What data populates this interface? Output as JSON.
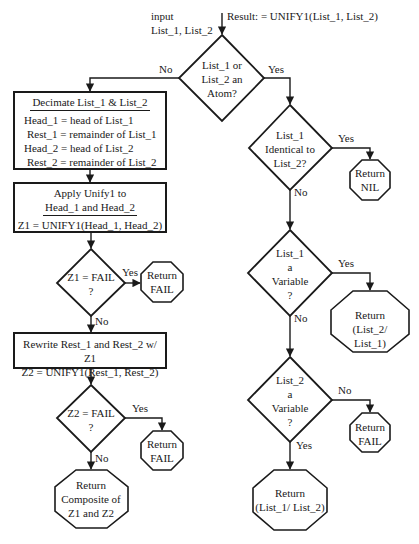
{
  "header": {
    "input_label": "input",
    "input_args": "List_1,  List_2",
    "call": "Result: = UNIFY1(List_1,  List_2)"
  },
  "nodes": {
    "atom_decision": {
      "lines": [
        "List_1 or",
        "List_2 an",
        "Atom?"
      ],
      "no": "No",
      "yes": "Yes"
    },
    "decimate_box": {
      "title": "Decimate List_1 & List_2",
      "lines": [
        "Head_1 = head of List_1",
        "Rest_1 = remainder of List_1",
        "Head_2 = head of List_2",
        "Rest_2 = remainder of List_2"
      ]
    },
    "apply_box": {
      "title_lines": [
        "Apply Unify1 to",
        "Head_1 and Head_2"
      ],
      "formula": "Z1 = UNIFY1(Head_1,  Head_2)"
    },
    "z1_decision": {
      "lines": [
        "Z1 = FAIL",
        "?"
      ],
      "yes": "Yes",
      "no": "No"
    },
    "z1_return": {
      "lines": [
        "Return",
        "FAIL"
      ]
    },
    "rewrite_box": {
      "lines": [
        "Rewrite Rest_1 and Rest_2 w/ Z1",
        "Z2 = UNIFY1(Rest_1,  Rest_2)"
      ]
    },
    "z2_decision": {
      "lines": [
        "Z2 = FAIL",
        "?"
      ],
      "yes": "Yes",
      "no": "No"
    },
    "z2_return": {
      "lines": [
        "Return",
        "FAIL"
      ]
    },
    "composite_return": {
      "lines": [
        "Return",
        "Composite of",
        "Z1 and Z2"
      ]
    },
    "identical_decision": {
      "lines": [
        "List_1",
        "Identical to",
        "List_2?"
      ],
      "yes": "Yes",
      "no": "No"
    },
    "nil_return": {
      "lines": [
        "Return",
        "NIL"
      ]
    },
    "var1_decision": {
      "lines": [
        "List_1",
        "a",
        "Variable",
        "?"
      ],
      "yes": "Yes",
      "no": "No"
    },
    "var1_return": {
      "lines": [
        "Return",
        "(List_2/ List_1)"
      ]
    },
    "var2_decision": {
      "lines": [
        "List_2",
        "a",
        "Variable",
        "?"
      ],
      "yes": "Yes",
      "no": "No"
    },
    "var2_fail_return": {
      "lines": [
        "Return",
        "FAIL"
      ]
    },
    "var2_return": {
      "lines": [
        "Return",
        "(List_1/ List_2)"
      ]
    }
  },
  "colors": {
    "stroke": "#1a1a1a",
    "background": "#ffffff"
  }
}
